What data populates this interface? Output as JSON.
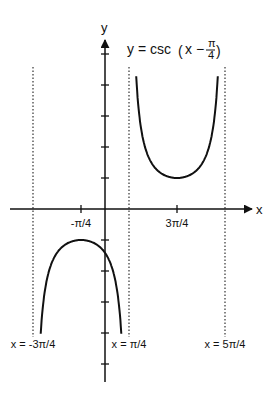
{
  "chart_data": {
    "type": "line",
    "title_parts": {
      "lhs": "y = csc",
      "open": "(",
      "x": "x −",
      "num": "π",
      "den": "4",
      "close": ")"
    },
    "xlabel": "x",
    "ylabel": "y",
    "xlim_pi_units": [
      -1.15,
      1.45
    ],
    "ylim": [
      -5.5,
      5.2
    ],
    "x_tick_labels": [
      {
        "value_pi": -0.25,
        "label": "-π/4"
      },
      {
        "value_pi": 0.75,
        "label": "3π/4"
      }
    ],
    "y_ticks": [
      -5,
      -4,
      -3,
      -2,
      -1,
      1,
      2,
      3,
      4,
      5
    ],
    "asymptotes": [
      {
        "value_pi": -0.75,
        "label": "x = -3π/4"
      },
      {
        "value_pi": 0.25,
        "label": "x = π/4"
      },
      {
        "value_pi": 1.25,
        "label": "x = 5π/4"
      }
    ],
    "series": [
      {
        "name": "upper branch",
        "function": "csc(x - π/4)",
        "x_range_pi": [
          0.25,
          1.25
        ],
        "y_clip": 4.5,
        "vertex": {
          "x_pi": 0.75,
          "y": 1
        }
      },
      {
        "name": "lower branch",
        "function": "csc(x - π/4)",
        "x_range_pi": [
          -0.75,
          0.25
        ],
        "y_clip": -4.2,
        "vertex": {
          "x_pi": -0.25,
          "y": -1
        }
      }
    ],
    "grid": false,
    "legend": "none"
  }
}
